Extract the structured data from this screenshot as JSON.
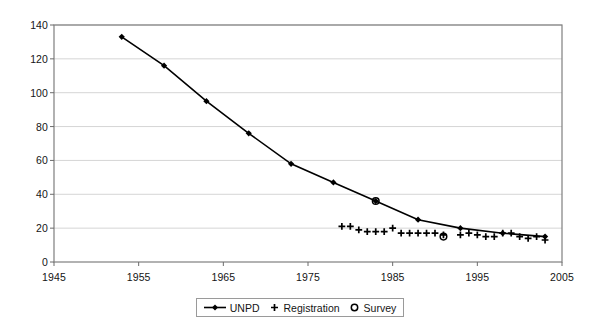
{
  "chart_data": {
    "type": "line",
    "title": "",
    "xlabel": "",
    "ylabel": "",
    "xlim": [
      1945,
      2005
    ],
    "ylim": [
      0,
      140
    ],
    "xticks": [
      1945,
      1955,
      1965,
      1975,
      1985,
      1995,
      2005
    ],
    "yticks": [
      0,
      20,
      40,
      60,
      80,
      100,
      120,
      140
    ],
    "grid": "horizontal",
    "legend_position": "bottom-center",
    "series": [
      {
        "name": "UNPD",
        "marker": "diamond",
        "line": true,
        "color": "#000000",
        "points": [
          {
            "x": 1953,
            "y": 133
          },
          {
            "x": 1958,
            "y": 116
          },
          {
            "x": 1963,
            "y": 95
          },
          {
            "x": 1968,
            "y": 76
          },
          {
            "x": 1973,
            "y": 58
          },
          {
            "x": 1978,
            "y": 47
          },
          {
            "x": 1983,
            "y": 36
          },
          {
            "x": 1988,
            "y": 25
          },
          {
            "x": 1993,
            "y": 20
          },
          {
            "x": 1998,
            "y": 17
          },
          {
            "x": 2003,
            "y": 15
          }
        ]
      },
      {
        "name": "Registration",
        "marker": "plus",
        "line": false,
        "color": "#000000",
        "points": [
          {
            "x": 1979,
            "y": 21
          },
          {
            "x": 1980,
            "y": 21
          },
          {
            "x": 1981,
            "y": 19
          },
          {
            "x": 1982,
            "y": 18
          },
          {
            "x": 1983,
            "y": 18
          },
          {
            "x": 1984,
            "y": 18
          },
          {
            "x": 1985,
            "y": 20
          },
          {
            "x": 1986,
            "y": 17
          },
          {
            "x": 1987,
            "y": 17
          },
          {
            "x": 1988,
            "y": 17
          },
          {
            "x": 1989,
            "y": 17
          },
          {
            "x": 1990,
            "y": 17
          },
          {
            "x": 1991,
            "y": 16
          },
          {
            "x": 1993,
            "y": 16
          },
          {
            "x": 1994,
            "y": 17
          },
          {
            "x": 1995,
            "y": 16
          },
          {
            "x": 1996,
            "y": 15
          },
          {
            "x": 1997,
            "y": 15
          },
          {
            "x": 1998,
            "y": 17
          },
          {
            "x": 1999,
            "y": 17
          },
          {
            "x": 2000,
            "y": 15
          },
          {
            "x": 2001,
            "y": 14
          },
          {
            "x": 2002,
            "y": 15
          },
          {
            "x": 2003,
            "y": 13
          }
        ]
      },
      {
        "name": "Survey",
        "marker": "circle",
        "line": false,
        "color": "#000000",
        "points": [
          {
            "x": 1983,
            "y": 36
          },
          {
            "x": 1991,
            "y": 15
          }
        ]
      }
    ]
  },
  "legend": {
    "items": [
      {
        "label": "UNPD",
        "symbol": "line-diamond"
      },
      {
        "label": "Registration",
        "symbol": "plus"
      },
      {
        "label": "Survey",
        "symbol": "circle"
      }
    ]
  }
}
